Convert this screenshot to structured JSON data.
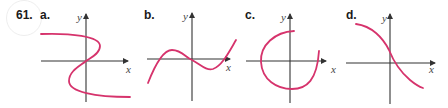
{
  "problem": {
    "number": "61.",
    "curve_color": "#d6336c",
    "axis_color": "#333333"
  },
  "panels": [
    {
      "label": "a.",
      "x_axis_label": "x",
      "y_axis_label": "y",
      "description": "S-shaped curve that is not a function (fails vertical line test)"
    },
    {
      "label": "b.",
      "x_axis_label": "x",
      "y_axis_label": "y",
      "description": "cubic-like curve passing through origin"
    },
    {
      "label": "c.",
      "x_axis_label": "x",
      "y_axis_label": "y",
      "description": "near-circular arc around origin"
    },
    {
      "label": "d.",
      "x_axis_label": "x",
      "y_axis_label": "y",
      "description": "decreasing S-shaped curve"
    }
  ]
}
